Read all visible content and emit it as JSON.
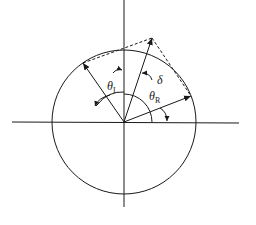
{
  "diagram": {
    "type": "vector-phasor-diagram",
    "labels": {
      "theta_left": {
        "symbol": "θ",
        "subscript": "L"
      },
      "theta_right": {
        "symbol": "θ",
        "subscript": "R"
      },
      "delta": "δ"
    },
    "colors": {
      "stroke": "#1a1a1a",
      "background": "#ffffff"
    },
    "elements": [
      "horizontal-axis",
      "vertical-axis",
      "circle",
      "left-vector",
      "right-vector",
      "resultant-vector",
      "dashed-parallelogram-lines",
      "theta-l-arc",
      "theta-r-arc",
      "delta-arc"
    ]
  }
}
